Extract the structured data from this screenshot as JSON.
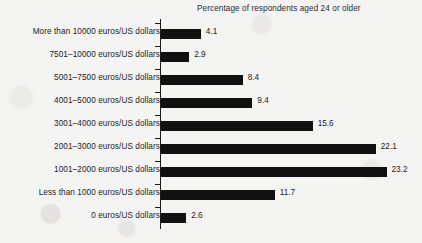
{
  "chart_data": {
    "type": "bar",
    "orientation": "horizontal",
    "title": "Percentage of respondents aged 24 or older",
    "xlabel": "",
    "ylabel": "",
    "grid": false,
    "legend": "none",
    "xlim": [
      0,
      25
    ],
    "categories": [
      "More than 10000 euros/US dollars",
      "7501–10000 euros/US dollars",
      "5001–7500 euros/US dollars",
      "4001–5000 euros/US dollars",
      "3001–4000 euros/US dollars",
      "2001–3000 euros/US dollars",
      "1001–2000 euros/US dollars",
      "Less than 1000 euros/US dollars",
      "0 euros/US dollars"
    ],
    "values": [
      4.1,
      2.9,
      8.4,
      9.4,
      15.6,
      22.1,
      23.2,
      11.7,
      2.6
    ],
    "value_labels": [
      "4.1",
      "2.9",
      "8.4",
      "9.4",
      "15.6",
      "22.1",
      "23.2",
      "11.7",
      "2.6"
    ],
    "bar_color": "#111111",
    "text_color": "#232323",
    "background_color": "#f4f4f2",
    "axis_color": "#1a1a1a"
  }
}
